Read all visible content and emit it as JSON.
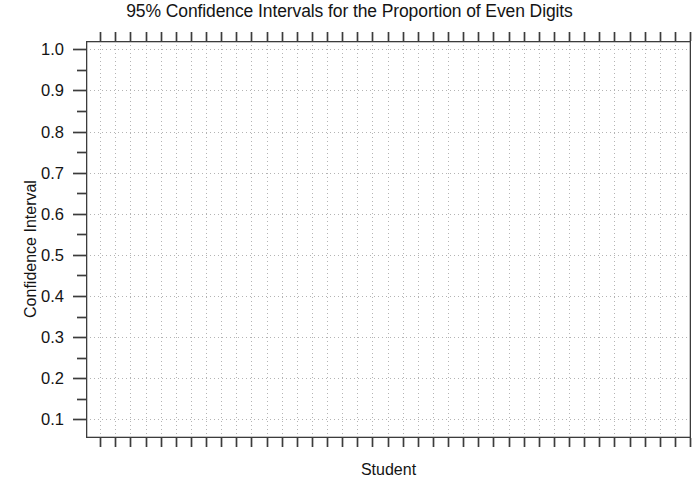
{
  "chart_data": {
    "type": "scatter",
    "title": "95% Confidence Intervals for the Proportion of Even Digits",
    "xlabel": "Student",
    "ylabel": "Confidence Interval",
    "series": [],
    "x": [],
    "values": [],
    "categories": [],
    "annotations": [],
    "legend": [],
    "legend_position": "none",
    "grid": true,
    "grid_style": "dotted",
    "ylim": [
      0.055,
      1.02
    ],
    "xlim": [
      0,
      40
    ],
    "y_major_ticks": [
      0.1,
      0.2,
      0.3,
      0.4,
      0.5,
      0.6,
      0.7,
      0.8,
      0.9,
      1.0
    ],
    "y_tick_labels": [
      "0.1",
      "0.2",
      "0.3",
      "0.4",
      "0.5",
      "0.6",
      "0.7",
      "0.8",
      "0.9",
      "1.0"
    ],
    "y_minor_ticks": [
      0.05,
      0.15,
      0.25,
      0.35,
      0.45,
      0.55,
      0.65,
      0.75,
      0.85,
      0.95
    ],
    "x_tick_count": 40,
    "x_tick_labels": [],
    "note": "Blank plotting template: axes, ticks and dotted gridlines only, no data plotted"
  },
  "chart": {
    "title": "95% Confidence Intervals for the Proportion of Even Digits",
    "x_axis_label": "Student",
    "y_axis_label": "Confidence Interval",
    "y_labels": [
      "1.0",
      "0.9",
      "0.8",
      "0.7",
      "0.6",
      "0.5",
      "0.4",
      "0.3",
      "0.2",
      "0.1"
    ]
  },
  "colors": {
    "axis": "#3c3c3c",
    "grid": "#b4b4b4",
    "text": "#141414",
    "background": "#ffffff"
  }
}
